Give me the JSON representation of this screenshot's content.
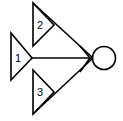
{
  "diagram": {
    "title": "",
    "colors": {
      "stroke": "#000000",
      "background": "#ffffff"
    },
    "triangles": [
      {
        "label": "1"
      },
      {
        "label": "2"
      },
      {
        "label": "3"
      }
    ],
    "nodes": [
      {
        "shape": "circle",
        "label": ""
      }
    ]
  }
}
